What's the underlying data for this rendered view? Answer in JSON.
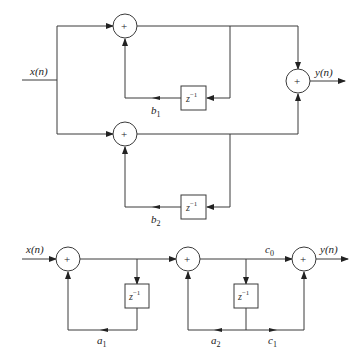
{
  "diagram": {
    "type": "signal-flow block diagram",
    "colors": {
      "line": "#3a3a3a",
      "background": "#ffffff"
    },
    "top": {
      "name": "parallel-form",
      "input_label": "x(n)",
      "output_label": "y(n)",
      "adder_symbol": "+",
      "delay_label": {
        "base": "z",
        "exp": "−1"
      },
      "branch1": {
        "coef": {
          "base": "b",
          "sub": "1"
        }
      },
      "branch2": {
        "coef": {
          "base": "b",
          "sub": "2"
        }
      }
    },
    "bottom": {
      "name": "cascade-form",
      "input_label": "x(n)",
      "output_label": "y(n)",
      "adder_symbol": "+",
      "delay_label": {
        "base": "z",
        "exp": "−1"
      },
      "coef_a1": {
        "base": "a",
        "sub": "1"
      },
      "coef_a2": {
        "base": "a",
        "sub": "2"
      },
      "coef_c0": {
        "base": "c",
        "sub": "0"
      },
      "coef_c1": {
        "base": "c",
        "sub": "1"
      }
    }
  }
}
